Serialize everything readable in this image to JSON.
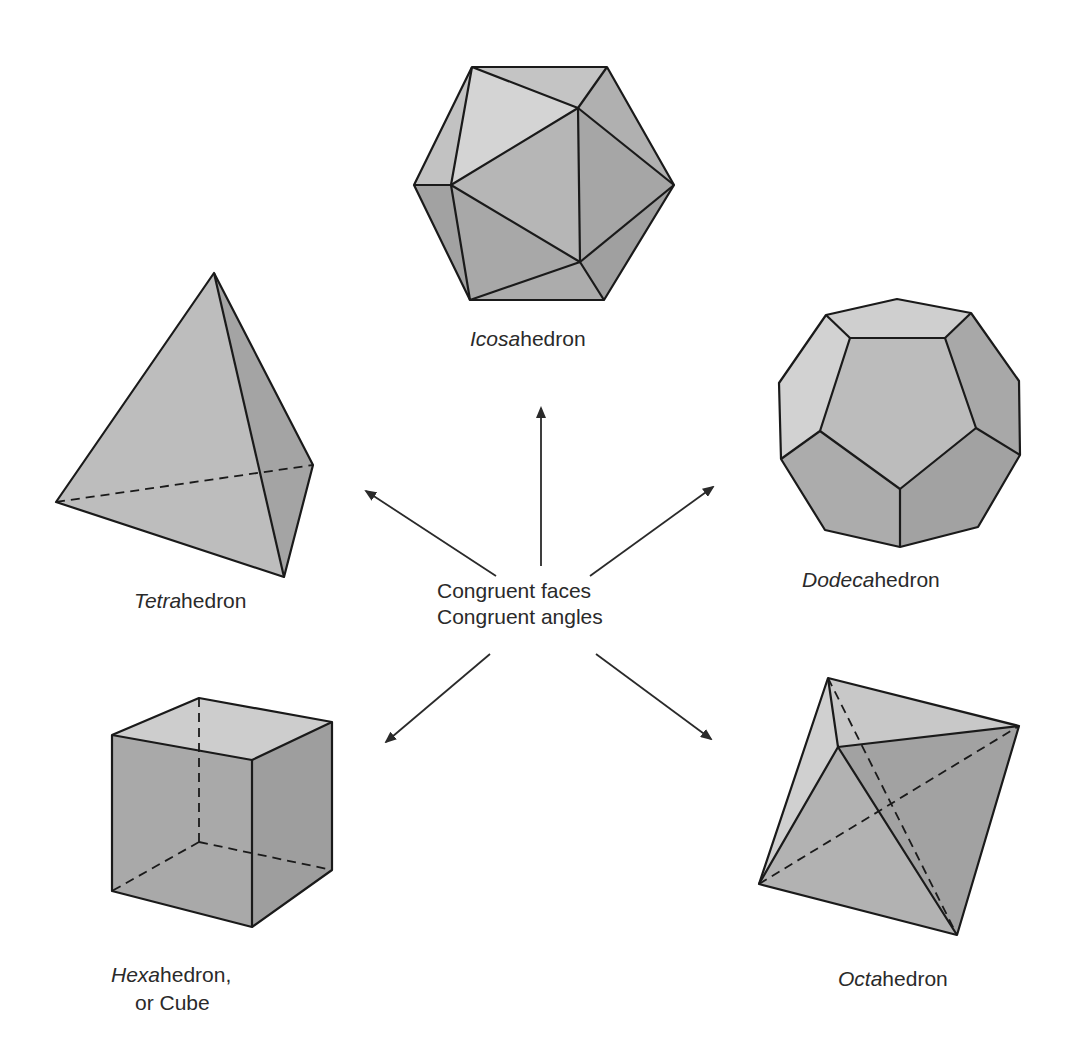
{
  "diagram": {
    "center_label": {
      "line1": "Congruent faces",
      "line2": "Congruent angles"
    },
    "solids": [
      {
        "name": "Icosahedron",
        "label_italic": "Icosa",
        "label_rest": "hedron",
        "faces": 20
      },
      {
        "name": "Dodecahedron",
        "label_italic": "Dodeca",
        "label_rest": "hedron",
        "faces": 12
      },
      {
        "name": "Octahedron",
        "label_italic": "Octa",
        "label_rest": "hedron",
        "faces": 8
      },
      {
        "name": "Hexahedron",
        "label_italic": "Hexa",
        "label_rest": "hedron,",
        "label_line2": "or Cube",
        "faces": 6
      },
      {
        "name": "Tetrahedron",
        "label_italic": "Tetra",
        "label_rest": "hedron",
        "faces": 4
      }
    ],
    "colors": {
      "background": "#ffffff",
      "edge": "#1a1a1a",
      "face_light": "#d2d2d2",
      "face_mid": "#b4b4b4",
      "face_dark": "#9c9c9c",
      "text": "#2a2a2a"
    }
  }
}
